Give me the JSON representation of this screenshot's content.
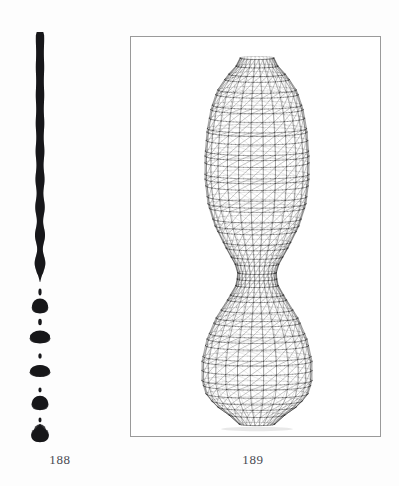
{
  "page": {
    "background_color": "#fdfdfd",
    "width": 399,
    "height": 486
  },
  "figures": [
    {
      "id": "fig-188",
      "caption": "188",
      "kind": "photograph",
      "subject": "liquid-jet-breakup",
      "description": "Vertical liquid jet column undulating and breaking into alternating main drops and small satellite droplets",
      "ink_color": "#1a1a1a",
      "framed": false
    },
    {
      "id": "fig-189",
      "caption": "189",
      "kind": "wireframe-render",
      "subject": "axisymmetric-pinched-surface",
      "description": "Triangulated wireframe mesh of a surface of revolution with two bulbs joined by a narrow neck",
      "line_color": "#2b2b2b",
      "frame_color": "#9a9a9a",
      "framed": true
    }
  ],
  "captions": {
    "left": "188",
    "right": "189"
  },
  "chart_data": {
    "type": "line",
    "xlabel": "",
    "ylabel": "",
    "panels": [
      {
        "name": "188",
        "type": "silhouette-profile",
        "axis_x_center": 40,
        "jet": {
          "top_y": 32,
          "breakup_y": 282,
          "base_half_width": 4.0,
          "wave_amplitude": 1.6,
          "wavelength": 28,
          "description": "Column half-width r(y) = base + amplitude*sin(2*pi*(y-top)/wavelength), amplitude growing toward breakup"
        },
        "droplets": [
          {
            "index": 1,
            "cy": 292,
            "rx": 1.6,
            "ry": 3.4,
            "role": "satellite"
          },
          {
            "index": 2,
            "cy": 306,
            "rx": 8.0,
            "ry": 7.5,
            "role": "main"
          },
          {
            "index": 3,
            "cy": 322,
            "rx": 1.8,
            "ry": 3.2,
            "role": "satellite"
          },
          {
            "index": 4,
            "cy": 337,
            "rx": 10.0,
            "ry": 6.4,
            "role": "main"
          },
          {
            "index": 5,
            "cy": 356,
            "rx": 1.7,
            "ry": 2.8,
            "role": "satellite"
          },
          {
            "index": 6,
            "cy": 371,
            "rx": 10.0,
            "ry": 6.0,
            "role": "main"
          },
          {
            "index": 7,
            "cy": 390,
            "rx": 1.6,
            "ry": 2.4,
            "role": "satellite"
          },
          {
            "index": 8,
            "cy": 403,
            "rx": 8.2,
            "ry": 7.2,
            "role": "main"
          },
          {
            "index": 9,
            "cy": 420,
            "rx": 1.5,
            "ry": 2.4,
            "role": "satellite"
          },
          {
            "index": 10,
            "cy": 433,
            "rx": 8.6,
            "ry": 9.2,
            "role": "main-teardrop"
          }
        ]
      },
      {
        "name": "189",
        "type": "surface-of-revolution-wireframe",
        "axis_x_center": 127,
        "top_y": 22,
        "bottom_y": 388,
        "meridians": 26,
        "rings": 48,
        "diagonals": true,
        "profile_note": "radius r(t) for t in [0,1] top to bottom",
        "profile": [
          {
            "t": 0.0,
            "y": 22,
            "r": 17
          },
          {
            "t": 0.02,
            "y": 30,
            "r": 21
          },
          {
            "t": 0.05,
            "y": 40,
            "r": 30
          },
          {
            "t": 0.09,
            "y": 55,
            "r": 40
          },
          {
            "t": 0.14,
            "y": 73,
            "r": 46
          },
          {
            "t": 0.2,
            "y": 95,
            "r": 50
          },
          {
            "t": 0.27,
            "y": 120,
            "r": 52
          },
          {
            "t": 0.33,
            "y": 143,
            "r": 52
          },
          {
            "t": 0.4,
            "y": 168,
            "r": 49
          },
          {
            "t": 0.46,
            "y": 190,
            "r": 42
          },
          {
            "t": 0.52,
            "y": 212,
            "r": 31
          },
          {
            "t": 0.56,
            "y": 228,
            "r": 22
          },
          {
            "t": 0.59,
            "y": 238,
            "r": 19
          },
          {
            "t": 0.62,
            "y": 249,
            "r": 21
          },
          {
            "t": 0.66,
            "y": 263,
            "r": 29
          },
          {
            "t": 0.71,
            "y": 282,
            "r": 41
          },
          {
            "t": 0.77,
            "y": 303,
            "r": 50
          },
          {
            "t": 0.83,
            "y": 325,
            "r": 55
          },
          {
            "t": 0.88,
            "y": 345,
            "r": 55
          },
          {
            "t": 0.92,
            "y": 358,
            "r": 51
          },
          {
            "t": 0.95,
            "y": 369,
            "r": 42
          },
          {
            "t": 0.98,
            "y": 379,
            "r": 28
          },
          {
            "t": 1.0,
            "y": 388,
            "r": 18
          }
        ]
      }
    ]
  }
}
